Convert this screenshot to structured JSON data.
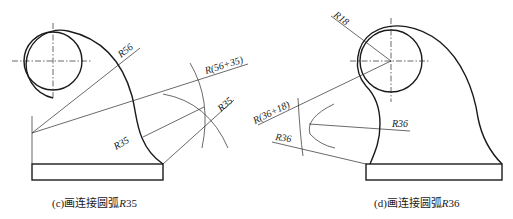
{
  "figures": [
    {
      "id": "c",
      "caption_prefix": "(c)",
      "caption_text": "画连接圆弧",
      "caption_r": "R",
      "caption_num": "35",
      "labels": {
        "r56": "R56",
        "r56_35": "R(56+35)",
        "r35_a": "R35",
        "r35_b": "R35"
      }
    },
    {
      "id": "d",
      "caption_prefix": "(d)",
      "caption_text": "画连接圆弧",
      "caption_r": "R",
      "caption_num": "36",
      "labels": {
        "r18": "R18",
        "r36_18": "R(36+18)",
        "r36_a": "R36",
        "r36_b": "R36"
      }
    }
  ],
  "colors": {
    "line": "#1a1a1a",
    "background": "#ffffff"
  }
}
